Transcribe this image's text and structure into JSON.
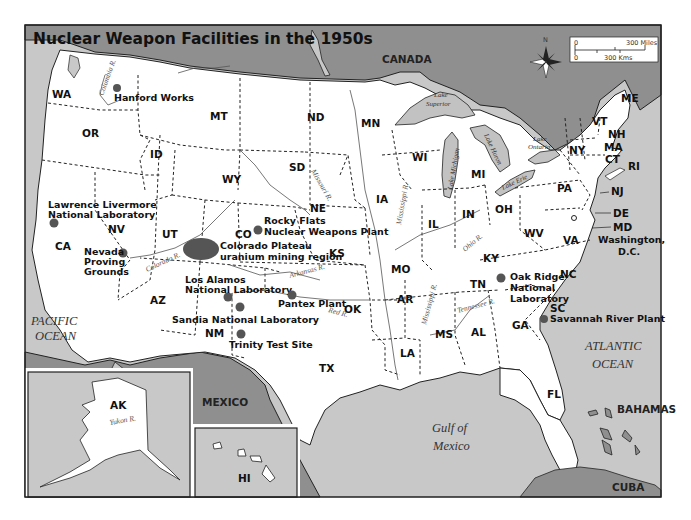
{
  "header": {
    "corner_text": "Nuclear Weapons Facilities · Map Figure"
  },
  "map": {
    "title": "Nuclear Weapon Facilities in the 1950s",
    "colors": {
      "water": "#c8c8c8",
      "us_land": "#ffffff",
      "foreign_land": "#8f8f8f",
      "lake": "#c2c2c2",
      "site_marker": "#555555",
      "frame": "#222222"
    },
    "countries": {
      "canada": "CANADA",
      "mexico": "MEXICO",
      "bahamas": "BAHAMAS",
      "cuba": "CUBA"
    },
    "oceans": {
      "pacific_1": "PACIFIC",
      "pacific_2": "OCEAN",
      "atlantic_1": "ATLANTIC",
      "atlantic_2": "OCEAN",
      "gulf_1": "Gulf of",
      "gulf_2": "Mexico"
    },
    "lakes": {
      "superior_1": "Lake",
      "superior_2": "Superior",
      "michigan": "Lake Michigan",
      "huron": "Lake Huron",
      "erie": "Lake Erie",
      "ontario_1": "Lake",
      "ontario_2": "Ontario"
    },
    "rivers": {
      "columbia": "Columbia R.",
      "missouri": "Missouri R.",
      "mississippi_n": "Mississippi R.",
      "mississippi_s": "Mississippi R.",
      "colorado": "Colorado R.",
      "arkansas": "Arkansas R.",
      "red": "Red R.",
      "ohio": "Ohio R.",
      "tennessee": "Tennessee R.",
      "yukon": "Yukon R."
    },
    "states": {
      "WA": "WA",
      "OR": "OR",
      "CA": "CA",
      "ID": "ID",
      "NV": "NV",
      "MT": "MT",
      "WY": "WY",
      "UT": "UT",
      "CO": "CO",
      "AZ": "AZ",
      "NM": "NM",
      "ND": "ND",
      "SD": "SD",
      "NE": "NE",
      "KS": "KS",
      "OK": "OK",
      "TX": "TX",
      "MN": "MN",
      "IA": "IA",
      "MO": "MO",
      "AR": "AR",
      "LA": "LA",
      "WI": "WI",
      "IL": "IL",
      "MI": "MI",
      "IN": "IN",
      "OH": "OH",
      "KY": "KY",
      "TN": "TN",
      "MS": "MS",
      "AL": "AL",
      "GA": "GA",
      "FL": "FL",
      "SC": "SC",
      "NC": "NC",
      "VA": "VA",
      "WV": "WV",
      "PA": "PA",
      "NY": "NY",
      "VT": "VT",
      "NH": "NH",
      "ME": "ME",
      "MA": "MA",
      "CT": "CT",
      "RI": "RI",
      "NJ": "NJ",
      "DE": "DE",
      "MD": "MD",
      "AK": "AK",
      "HI": "HI"
    },
    "capital": {
      "line1": "Washington,",
      "line2": "D.C."
    },
    "sites": [
      {
        "name": "Hanford Works",
        "lines": [
          "Hanford Works"
        ]
      },
      {
        "name": "Lawrence Livermore National Laboratory",
        "lines": [
          "Lawrence Livermore",
          "National Laboratory"
        ]
      },
      {
        "name": "Nevada Proving Grounds",
        "lines": [
          "Nevada",
          "Proving",
          "Grounds"
        ]
      },
      {
        "name": "Rocky Flats Nuclear Weapons Plant",
        "lines": [
          "Rocky Flats",
          "Nuclear Weapons Plant"
        ]
      },
      {
        "name": "Colorado Plateau uranium mining region",
        "lines": [
          "Colorado Plateau",
          "uranium mining region"
        ]
      },
      {
        "name": "Los Alamos National Laboratory",
        "lines": [
          "Los Alamos",
          "National Laboratory"
        ]
      },
      {
        "name": "Sandia National Laboratory",
        "lines": [
          "Sandia National Laboratory"
        ]
      },
      {
        "name": "Trinity Test Site",
        "lines": [
          "Trinity Test Site"
        ]
      },
      {
        "name": "Pantex Plant",
        "lines": [
          "Pantex Plant"
        ]
      },
      {
        "name": "Oak Ridge National Laboratory",
        "lines": [
          "Oak Ridge",
          "National",
          "Laboratory"
        ]
      },
      {
        "name": "Savannah River Plant",
        "lines": [
          "Savannah River Plant"
        ]
      }
    ],
    "compass": {
      "label": "N"
    },
    "scale_bar": {
      "miles_zero": "0",
      "miles_label": "300 Miles",
      "km_zero": "0",
      "km_label": "300 Kms"
    }
  }
}
